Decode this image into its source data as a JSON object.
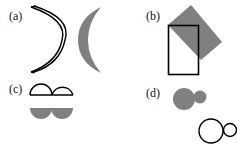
{
  "panels": [
    {
      "id": "a",
      "label": "(a)",
      "description": "outlined crescent and filled grey crescent"
    },
    {
      "id": "b",
      "label": "(b)",
      "description": "outlined rectangle overlapping rotated grey rectangle"
    },
    {
      "id": "c",
      "label": "(c)",
      "description": "two outlined upper semicircles above two filled grey lower semicircles"
    },
    {
      "id": "d",
      "label": "(d)",
      "description": "grey large+small circles and outlined large+small circles"
    }
  ],
  "colors": {
    "fill": "#808080",
    "stroke": "#000000",
    "text": "#111111"
  }
}
